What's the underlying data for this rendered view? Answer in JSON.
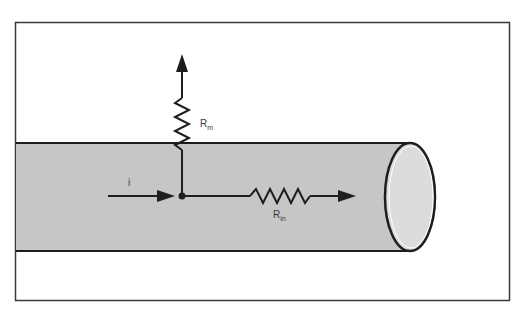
{
  "diagram": {
    "labels": {
      "current": "i",
      "membrane_resistance_main": "R",
      "membrane_resistance_sub": "m",
      "internal_resistance_main": "R",
      "internal_resistance_sub": "in"
    },
    "colors": {
      "background": "#ffffff",
      "frame": "#3a3a3a",
      "cylinder_body": "#c8c8c8",
      "cylinder_end": "#dcdcdc",
      "stroke": "#1e1e1e"
    }
  }
}
